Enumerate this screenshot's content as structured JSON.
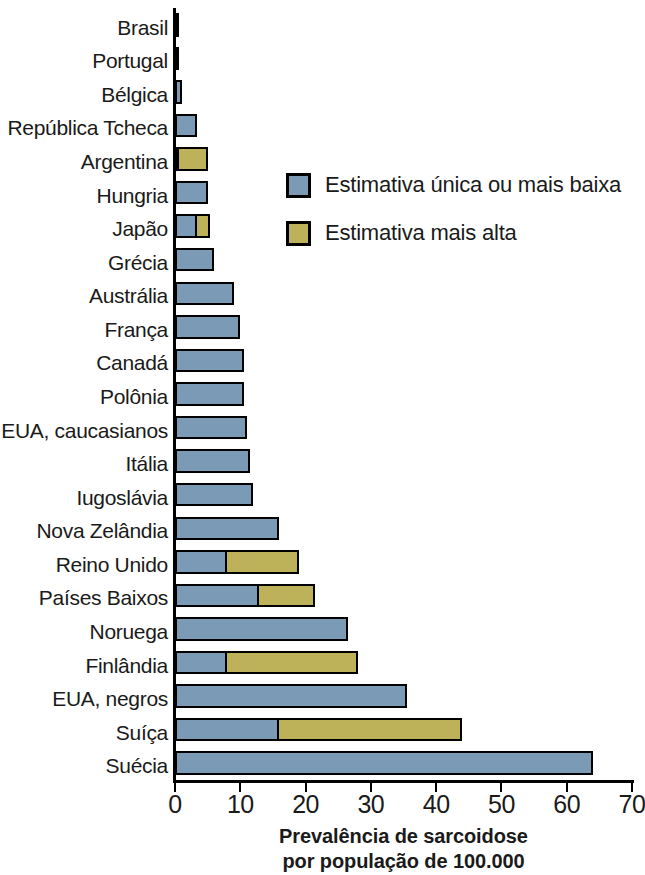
{
  "chart_data": {
    "type": "bar",
    "orientation": "horizontal",
    "stacked": true,
    "title": "",
    "xlabel_line1": "Prevalência de sarcoidose",
    "xlabel_line2": "por população de 100.000",
    "ylabel": "",
    "xlim": [
      0,
      70
    ],
    "xticks": [
      0,
      10,
      20,
      30,
      40,
      50,
      60,
      70
    ],
    "xtick_labels": [
      "0",
      "10",
      "20",
      "30",
      "40",
      "50",
      "60",
      "70"
    ],
    "grid": false,
    "legend_position": "inside-upper-right",
    "series": [
      {
        "name": "Estimativa única ou mais baixa",
        "color": "#7b9ab5",
        "values": [
          0.2,
          0.2,
          1.0,
          3.3,
          0.7,
          5.0,
          3.5,
          6.0,
          9.0,
          10.0,
          10.5,
          10.5,
          11.0,
          11.5,
          12.0,
          16.0,
          8.0,
          13.0,
          26.5,
          8.0,
          35.5,
          16.0,
          64.0
        ]
      },
      {
        "name": "Estimativa mais alta",
        "color": "#bdb159",
        "values": [
          0,
          0,
          0,
          0,
          5.0,
          0,
          5.3,
          0,
          0,
          0,
          0,
          0,
          0,
          0,
          0,
          0,
          19.0,
          21.5,
          0,
          28.0,
          0,
          44.0,
          0
        ]
      }
    ],
    "categories": [
      "Brasil",
      "Portugal",
      "Bélgica",
      "República Tcheca",
      "Argentina",
      "Hungria",
      "Japão",
      "Grécia",
      "Austrália",
      "França",
      "Canadá",
      "Polônia",
      "EUA, caucasianos",
      "Itália",
      "Iugoslávia",
      "Nova Zelândia",
      "Reino Unido",
      "Países Baixos",
      "Noruega",
      "Finlândia",
      "EUA, negros",
      "Suíça",
      "Suécia"
    ]
  },
  "legend": {
    "items": [
      {
        "label": "Estimativa única ou mais baixa",
        "color": "#7b9ab5"
      },
      {
        "label": "Estimativa mais alta",
        "color": "#bdb159"
      }
    ]
  },
  "axis": {
    "x_title_line1": "Prevalência de sarcoidose",
    "x_title_line2": "por população de 100.000",
    "x_tick_labels": [
      "0",
      "10",
      "20",
      "30",
      "40",
      "50",
      "60",
      "70"
    ]
  },
  "colors": {
    "low_estimate": "#7b9ab5",
    "high_estimate": "#bdb159",
    "axis": "#000000",
    "background": "#ffffff"
  }
}
